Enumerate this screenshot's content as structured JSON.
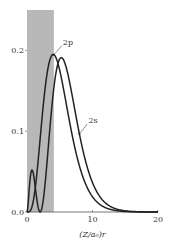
{
  "chart_data": {
    "type": "line",
    "title": "",
    "xlabel": "(Z/a₀)r",
    "ylabel": "",
    "xlim": [
      0,
      20
    ],
    "ylim": [
      0,
      0.25
    ],
    "grid": false,
    "x_ticks": [
      0,
      10,
      20
    ],
    "x_tick_labels": [
      "0",
      "10",
      "20"
    ],
    "y_ticks": [
      0.0,
      0.1,
      0.2
    ],
    "y_tick_labels": [
      "0.0",
      "0.1",
      "0.2"
    ],
    "shaded_region": {
      "x_start": 0,
      "x_end": 4.1,
      "color": "#b8b8b8"
    },
    "series": [
      {
        "name": "2s",
        "label": "2s",
        "function": "radial_probability_2s",
        "peak": {
          "x": 5.2,
          "y": 0.191
        },
        "secondary_peak": {
          "x": 0.76,
          "y": 0.052
        },
        "node": 2.0,
        "color": "#222222"
      },
      {
        "name": "2p",
        "label": "2p",
        "function": "radial_probability_2p",
        "peak": {
          "x": 4.0,
          "y": 0.195
        },
        "color": "#222222"
      }
    ],
    "annotations": [
      {
        "text": "2p",
        "points_to_series": "2p",
        "at_x": 4.1
      },
      {
        "text": "2s",
        "points_to_series": "2s",
        "at_x": 8.0
      }
    ]
  }
}
